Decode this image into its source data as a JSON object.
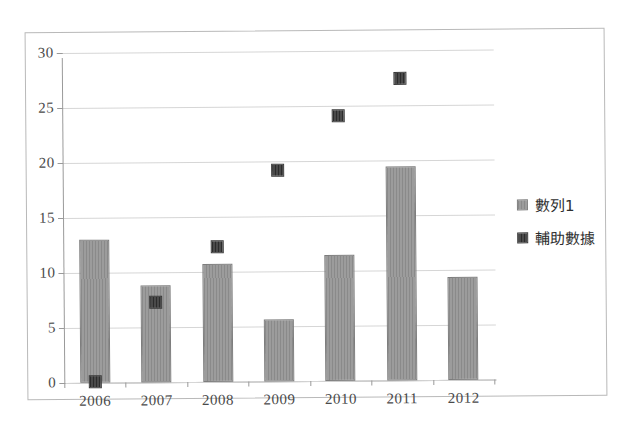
{
  "chart_data": {
    "type": "bar",
    "title": "",
    "xlabel": "",
    "ylabel": "",
    "categories": [
      "2006",
      "2007",
      "2008",
      "2009",
      "2010",
      "2011",
      "2012"
    ],
    "ylim": [
      0,
      30
    ],
    "ytick_labels": [
      "0",
      "5",
      "10",
      "15",
      "20",
      "25",
      "30"
    ],
    "ytick_values": [
      0,
      5,
      10,
      15,
      20,
      25,
      30
    ],
    "grid": true,
    "legend_position": "right",
    "series": [
      {
        "name": "數列1",
        "plot_type": "bar",
        "color": "#9c9c9c",
        "values": [
          13.0,
          8.8,
          10.7,
          5.6,
          11.5,
          19.5,
          9.4
        ]
      },
      {
        "name": "輔助數據",
        "plot_type": "scatter",
        "color": "#3a3a3a",
        "values": [
          0.1,
          7.3,
          12.3,
          19.2,
          24.1,
          27.5,
          null
        ]
      }
    ]
  },
  "legend": {
    "items": [
      {
        "label": "數列1",
        "swatch": "series1-swatch-icon"
      },
      {
        "label": "輔助數據",
        "swatch": "aux-swatch-icon"
      }
    ]
  }
}
